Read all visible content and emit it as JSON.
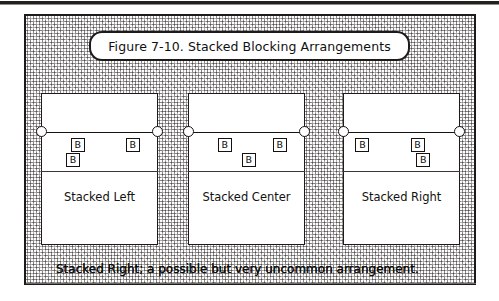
{
  "figure": {
    "title": "Figure 7-10. Stacked Blocking Arrangements",
    "caption": "Stacked Right; a possible but very uncommon arrangement.",
    "border_color": "#1d1b19",
    "background": "stipple-dither-gray",
    "panels": [
      {
        "label": "Stacked Left",
        "net_posts": [
          "left",
          "right"
        ],
        "blockers": [
          {
            "id": "B",
            "row": 1,
            "x_pct": 31,
            "note": "front-row blocker left of center"
          },
          {
            "id": "B",
            "row": 1,
            "x_pct": 79,
            "note": "front-row blocker right side"
          },
          {
            "id": "B",
            "row": 2,
            "x_pct": 27,
            "note": "stacked behind left blocker"
          }
        ]
      },
      {
        "label": "Stacked Center",
        "net_posts": [
          "left",
          "right"
        ],
        "blockers": [
          {
            "id": "B",
            "row": 1,
            "x_pct": 31,
            "note": "front-row blocker left of center"
          },
          {
            "id": "B",
            "row": 1,
            "x_pct": 79,
            "note": "front-row blocker right side"
          },
          {
            "id": "B",
            "row": 2,
            "x_pct": 52,
            "note": "stacked behind center"
          }
        ]
      },
      {
        "label": "Stacked Right",
        "net_posts": [
          "left",
          "right"
        ],
        "blockers": [
          {
            "id": "B",
            "row": 1,
            "x_pct": 16,
            "note": "front-row blocker left side"
          },
          {
            "id": "B",
            "row": 1,
            "x_pct": 64,
            "note": "front-row blocker right of center"
          },
          {
            "id": "B",
            "row": 2,
            "x_pct": 69,
            "note": "stacked behind right blocker"
          }
        ]
      }
    ]
  }
}
